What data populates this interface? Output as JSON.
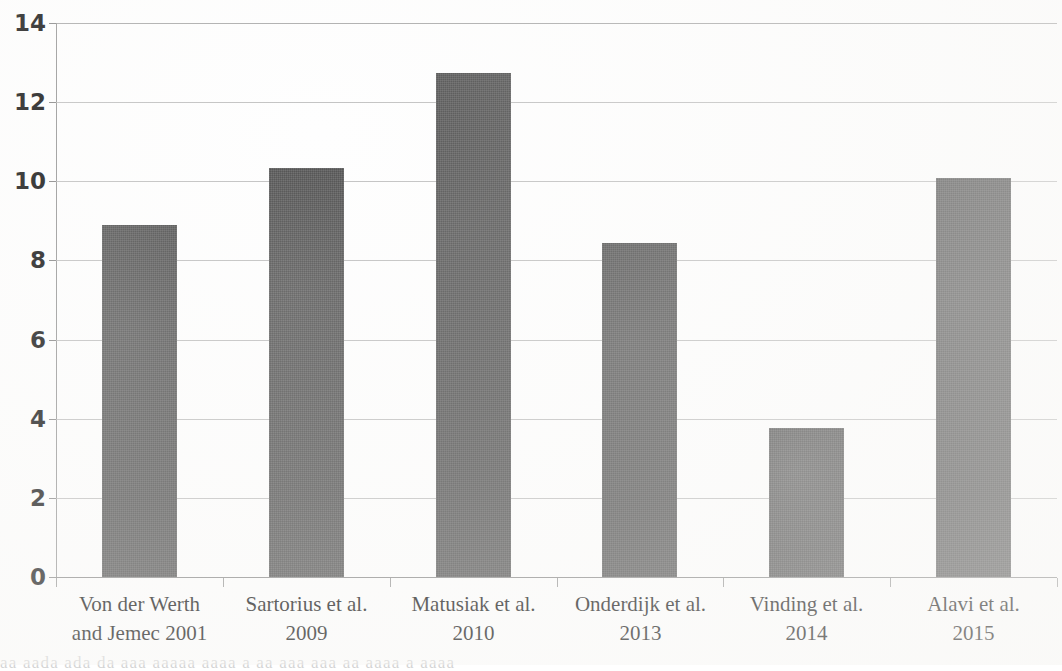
{
  "chart_data": {
    "type": "bar",
    "title": "",
    "xlabel": "",
    "ylabel": "",
    "ylim": [
      0,
      14
    ],
    "ytick_step": 2,
    "grid": true,
    "legend": false,
    "bar_color": "#5a5a5a",
    "categories": [
      "Von der Werth and Jemec 2001",
      "Sartorius et al. 2009",
      "Matusiak et al. 2010",
      "Onderdijk et al. 2013",
      "Vinding et al. 2014",
      "Alavi et al. 2015"
    ],
    "category_lines": [
      [
        "Von der Werth",
        "and Jemec 2001"
      ],
      [
        "Sartorius et al.",
        "2009"
      ],
      [
        "Matusiak et al.",
        "2010"
      ],
      [
        "Onderdijk et al.",
        "2013"
      ],
      [
        "Vinding et al.",
        "2014"
      ],
      [
        "Alavi et al.",
        "2015"
      ]
    ],
    "values": [
      8.9,
      10.33,
      12.73,
      8.43,
      3.77,
      10.08
    ],
    "ytick_labels": [
      "14",
      "12",
      "10",
      "8",
      "6",
      "4",
      "2",
      "0"
    ],
    "ytick_values": [
      14,
      12,
      10,
      8,
      6,
      4,
      2,
      0
    ]
  },
  "scan": {
    "ghost_text": "aa   aada  ada da aaa  aaaaa  aaaa  a aa  aaa aaa  aa  aaaa a aaaa"
  }
}
